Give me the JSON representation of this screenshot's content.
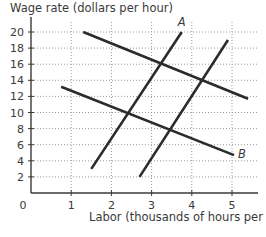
{
  "chart_data": {
    "type": "line",
    "title": "",
    "xlabel": "Labor (thousands of hours per day)",
    "ylabel": "Wage rate (dollars per hour)",
    "xlim": [
      0,
      5.5
    ],
    "ylim": [
      0,
      21
    ],
    "x_ticks": [
      1,
      2,
      3,
      4,
      5
    ],
    "y_ticks": [
      2,
      4,
      6,
      8,
      10,
      12,
      14,
      16,
      18,
      20
    ],
    "origin_label": "0",
    "grid": true,
    "grid_style": "dotted",
    "series": [
      {
        "name": "A",
        "kind": "upward-sloping",
        "points": [
          [
            1.5,
            3
          ],
          [
            3.75,
            20
          ]
        ],
        "label": "A",
        "label_at": [
          3.75,
          21.2
        ]
      },
      {
        "name": "supply-right",
        "kind": "upward-sloping",
        "points": [
          [
            2.7,
            2
          ],
          [
            4.9,
            19
          ]
        ],
        "label": ""
      },
      {
        "name": "demand-high",
        "kind": "downward-sloping",
        "points": [
          [
            1.3,
            20
          ],
          [
            5.4,
            11.7
          ]
        ],
        "label": ""
      },
      {
        "name": "B",
        "kind": "downward-sloping",
        "points": [
          [
            0.75,
            13.2
          ],
          [
            5.05,
            4.7
          ]
        ],
        "label": "B",
        "label_at": [
          5.25,
          4.9
        ]
      }
    ],
    "intersections": [
      {
        "x": 3.25,
        "y": 16
      },
      {
        "x": 4.25,
        "y": 14
      },
      {
        "x": 2.45,
        "y": 10
      },
      {
        "x": 3.45,
        "y": 8
      }
    ],
    "line_color": "#2b2b2b",
    "grid_color": "#9a9a9a"
  },
  "labels": {
    "ylabel": "Wage rate (dollars per hour)",
    "xlabel": "Labor (thousands of hours per day)",
    "caption": "The Figure is labor market for in the data..."
  }
}
